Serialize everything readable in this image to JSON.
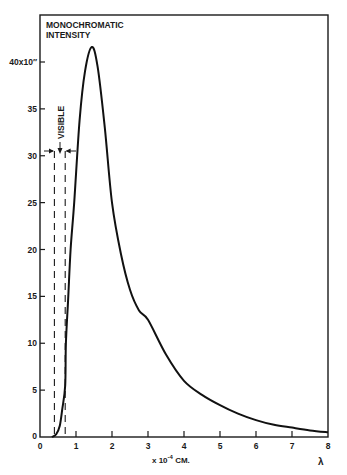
{
  "chart_data": {
    "type": "line",
    "title": "MONOCHROMATIC INTENSITY",
    "title_lines": [
      "MONOCHROMATIC",
      "INTENSITY"
    ],
    "xlabel": "x 10⁻⁴ CM.",
    "xlabel_parts": {
      "prefix": "x 10",
      "exponent": "-4",
      "suffix": " CM."
    },
    "x_symbol": "λ",
    "ylabel_top_tick": "40x10″",
    "xlim": [
      0,
      8
    ],
    "ylim": [
      0,
      45
    ],
    "x_ticks": [
      "0",
      "1",
      "2",
      "3",
      "4",
      "5",
      "6",
      "7",
      "8"
    ],
    "y_ticks": [
      "0",
      "5",
      "10",
      "15",
      "20",
      "25",
      "30",
      "35",
      "40x10″"
    ],
    "y_tick_values": [
      0,
      5,
      10,
      15,
      20,
      25,
      30,
      35,
      40
    ],
    "grid": false,
    "legend": null,
    "annotations": [
      {
        "text": "VISIBLE",
        "type": "bracket",
        "x_range": [
          0.4,
          0.7
        ],
        "y": 30.5,
        "orientation": "vertical-text"
      }
    ],
    "series": [
      {
        "name": "Monochromatic intensity",
        "x": [
          0.33,
          0.45,
          0.55,
          0.62,
          0.7,
          0.72,
          0.78,
          0.85,
          0.95,
          1.1,
          1.25,
          1.44,
          1.6,
          1.8,
          2.0,
          2.25,
          2.5,
          2.75,
          3.0,
          3.5,
          4.0,
          4.5,
          5.0,
          5.5,
          6.0,
          6.5,
          7.0,
          7.5,
          8.0
        ],
        "values": [
          0.0,
          0.3,
          1.2,
          3.0,
          5.5,
          10.0,
          14.6,
          20.0,
          25.0,
          33.8,
          39.0,
          41.6,
          39.5,
          33.0,
          25.0,
          19.5,
          15.7,
          13.5,
          12.5,
          8.8,
          6.0,
          4.5,
          3.4,
          2.5,
          1.8,
          1.3,
          1.0,
          0.7,
          0.5
        ]
      }
    ]
  }
}
